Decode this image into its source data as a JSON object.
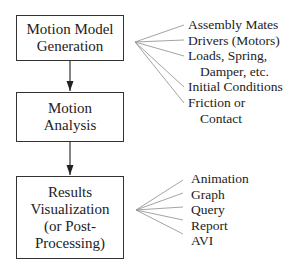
{
  "diagram": {
    "boxes": [
      {
        "id": "motion-model-generation",
        "lines": [
          "Motion Model",
          "Generation"
        ]
      },
      {
        "id": "motion-analysis",
        "lines": [
          "Motion",
          "Analysis"
        ]
      },
      {
        "id": "results-visualization",
        "lines": [
          "Results",
          "Visualization",
          "(or Post-",
          "Processing)"
        ]
      }
    ],
    "model_inputs": {
      "lines": [
        "Assembly Mates",
        "Drivers (Motors)",
        "Loads, Spring,",
        "Damper, etc.",
        "Initial Conditions",
        "Friction or",
        "Contact"
      ]
    },
    "result_outputs": {
      "lines": [
        "Animation",
        "Graph",
        "Query",
        "Report",
        "AVI"
      ]
    },
    "colors": {
      "line": "#333333",
      "fan": "#888888",
      "text": "#222222"
    }
  }
}
